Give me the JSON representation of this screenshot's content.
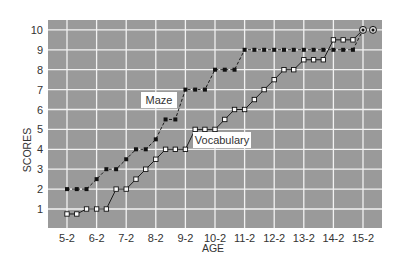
{
  "chart_data": {
    "type": "line",
    "title": "",
    "xlabel": "AGE",
    "ylabel": "SCORES",
    "x_ticks": [
      "5-2",
      "6-2",
      "7-2",
      "8-2",
      "9-2",
      "10-2",
      "11-2",
      "12-2",
      "13-2",
      "14-2",
      "15-2"
    ],
    "y_ticks": [
      1,
      2,
      3,
      4,
      5,
      6,
      7,
      8,
      9,
      10
    ],
    "ylim": [
      0,
      10.5
    ],
    "xlim_years": [
      4.55,
      15.9
    ],
    "grid": true,
    "legend": "inline labels",
    "x": [
      5.17,
      5.5,
      5.83,
      6.17,
      6.5,
      6.83,
      7.17,
      7.5,
      7.83,
      8.17,
      8.5,
      8.83,
      9.17,
      9.5,
      9.83,
      10.17,
      10.5,
      10.83,
      11.17,
      11.5,
      11.83,
      12.17,
      12.5,
      12.83,
      13.17,
      13.5,
      13.83,
      14.17,
      14.5,
      14.83,
      15.17
    ],
    "series": [
      {
        "name": "Maze",
        "style": "dashed, filled markers",
        "values": [
          2,
          2,
          2,
          2.5,
          3,
          3,
          3.5,
          4,
          4,
          4.5,
          5.5,
          5.5,
          7,
          7,
          7,
          8,
          8,
          8,
          9,
          9,
          9,
          9,
          9,
          9,
          9,
          9,
          9,
          9,
          9,
          9,
          10
        ]
      },
      {
        "name": "Vocabulary",
        "style": "solid, open markers",
        "values": [
          0.75,
          0.75,
          1,
          1,
          1,
          2,
          2,
          2.5,
          3,
          3.5,
          4,
          4,
          4,
          5,
          5,
          5,
          5.5,
          6,
          6,
          6.5,
          7,
          7.5,
          8,
          8,
          8.5,
          8.5,
          8.5,
          9.5,
          9.5,
          9.5,
          10
        ]
      }
    ],
    "annotations": [
      "Maze",
      "Vocabulary"
    ],
    "colors": {
      "plot_bg": "#9a9a9a",
      "grid": "#f2f2f2",
      "line": "#1a1a1a"
    }
  },
  "labels": {
    "maze": "Maze",
    "vocabulary": "Vocabulary",
    "xlabel": "AGE",
    "ylabel": "SCORES"
  }
}
